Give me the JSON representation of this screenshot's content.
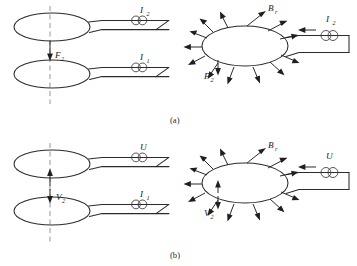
{
  "figure": {
    "panels": [
      {
        "id": "a",
        "caption": "(a)",
        "left_diagram": {
          "name": "two-loop-attraction",
          "centerline": "dashed vertical axis",
          "interaction_symbol": "single downward arrow",
          "interaction_label": "F",
          "interaction_subscript": "2",
          "upper_loop_label": "I",
          "upper_loop_subscript": "2",
          "lower_loop_label": "I",
          "lower_loop_subscript": "1",
          "coil_icon": "coil-icon"
        },
        "right_diagram": {
          "name": "single-loop-radial-field",
          "field_label": "B",
          "field_subscript": "r",
          "force_label": "F",
          "force_subscript": "2",
          "current_label": "I",
          "current_subscript": "2",
          "radial_arrow_count": 14,
          "current_direction": "leftward into loop",
          "coil_icon": "coil-icon"
        }
      },
      {
        "id": "b",
        "caption": "(b)",
        "left_diagram": {
          "name": "two-loop-repulsion",
          "centerline": "dashed vertical axis",
          "interaction_symbol": "double opposing arrows",
          "interaction_label": "V",
          "interaction_subscript": "2",
          "upper_loop_label": "U",
          "upper_loop_subscript": "",
          "lower_loop_label": "I",
          "lower_loop_subscript": "1",
          "coil_icon": "coil-icon"
        },
        "right_diagram": {
          "name": "single-loop-radial-field",
          "field_label": "B",
          "field_subscript": "r",
          "force_label": "V",
          "force_subscript": "2",
          "current_label": "U",
          "current_subscript": "",
          "radial_arrow_count": 14,
          "current_direction": "leftward into loop",
          "coil_icon": "coil-icon"
        }
      }
    ],
    "colors": {
      "ink": "#2b2b2b",
      "dashed": "#8a8a8a",
      "background": "#ffffff"
    }
  }
}
